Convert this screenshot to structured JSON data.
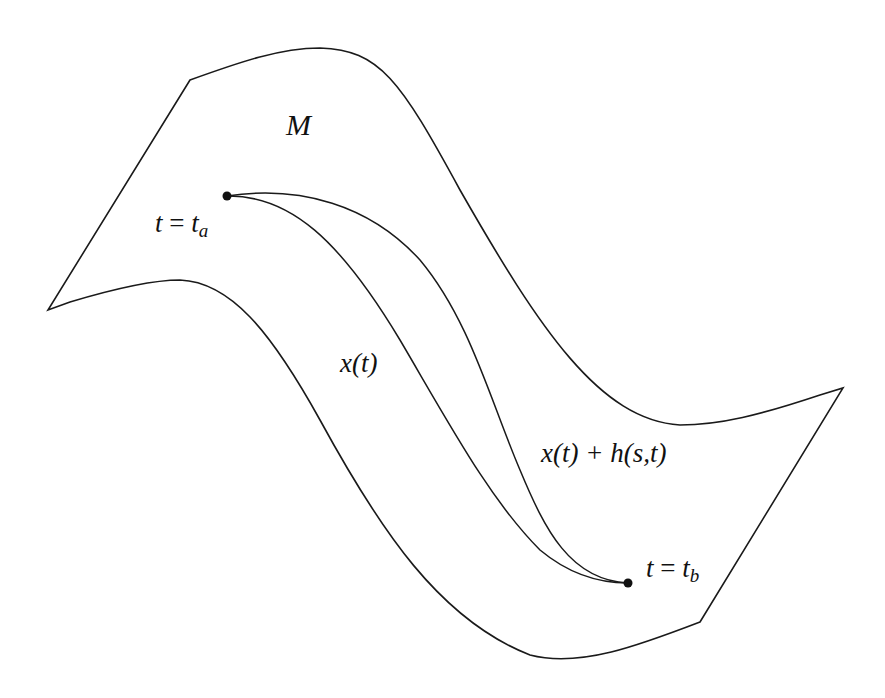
{
  "diagram": {
    "colors": {
      "stroke": "#1a1a1a",
      "background": "#ffffff",
      "text": "#111111"
    },
    "manifold": {
      "label": "M"
    },
    "start_point": {
      "label_var": "t",
      "label_eq": "=",
      "label_val": "t",
      "label_sub": "a"
    },
    "end_point": {
      "label_var": "t",
      "label_eq": "=",
      "label_val": "t",
      "label_sub": "b"
    },
    "curves": [
      {
        "name": "base-path",
        "label": "x(t)"
      },
      {
        "name": "varied-path",
        "label": "x(t) + h(s,t)"
      }
    ]
  }
}
